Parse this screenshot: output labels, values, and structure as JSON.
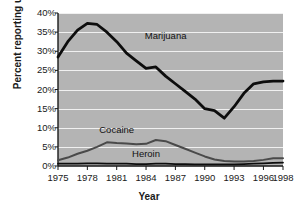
{
  "chart_data": {
    "type": "line",
    "title": "",
    "xlabel": "Year",
    "ylabel": "Percent reporting use",
    "xlim": [
      1975,
      1998
    ],
    "ylim": [
      0,
      40
    ],
    "grid": true,
    "legend_position": "inline-annotations",
    "ytick_labels": [
      "40%",
      "35%",
      "30%",
      "25%",
      "20%",
      "15%",
      "10%",
      "5%",
      "0%"
    ],
    "ytick_values": [
      40,
      35,
      30,
      25,
      20,
      15,
      10,
      5,
      0
    ],
    "xtick_labels": [
      "1975",
      "1978",
      "1981",
      "1984",
      "1987",
      "1990",
      "1993",
      "1996",
      "1998"
    ],
    "xtick_values": [
      1975,
      1978,
      1981,
      1984,
      1987,
      1990,
      1993,
      1996,
      1998
    ],
    "x": [
      1975,
      1976,
      1977,
      1978,
      1979,
      1980,
      1981,
      1982,
      1983,
      1984,
      1985,
      1986,
      1987,
      1988,
      1989,
      1990,
      1991,
      1992,
      1993,
      1994,
      1995,
      1996,
      1997,
      1998
    ],
    "series": [
      {
        "name": "Marijuana",
        "color": "#0d0d0d",
        "values": [
          28.5,
          32.5,
          35.5,
          37.3,
          37.0,
          35.0,
          32.5,
          29.5,
          27.5,
          25.5,
          25.9,
          23.5,
          21.5,
          19.5,
          17.5,
          15.0,
          14.5,
          12.5,
          15.5,
          19.0,
          21.5,
          22.0,
          22.2,
          22.2
        ],
        "label_x": 1986,
        "label_y": 34
      },
      {
        "name": "Cocaine",
        "color": "#4a4a4a",
        "values": [
          1.5,
          2.2,
          3.2,
          4.0,
          5.0,
          6.2,
          6.0,
          5.9,
          5.7,
          5.8,
          6.8,
          6.5,
          5.5,
          4.5,
          3.5,
          2.5,
          1.7,
          1.3,
          1.2,
          1.2,
          1.3,
          1.6,
          2.0,
          2.0
        ],
        "label_x": 1981,
        "label_y": 9.5
      },
      {
        "name": "Heroin",
        "color": "#0d0d0d",
        "values": [
          0.6,
          0.6,
          0.6,
          0.7,
          0.7,
          0.6,
          0.6,
          0.6,
          0.5,
          0.5,
          0.6,
          0.6,
          0.5,
          0.5,
          0.4,
          0.4,
          0.4,
          0.4,
          0.4,
          0.5,
          0.6,
          0.7,
          0.8,
          0.9
        ],
        "label_x": 1984,
        "label_y": 3.2
      }
    ]
  },
  "axis": {
    "y_title": "Percent reporting use",
    "x_title": "Year"
  }
}
